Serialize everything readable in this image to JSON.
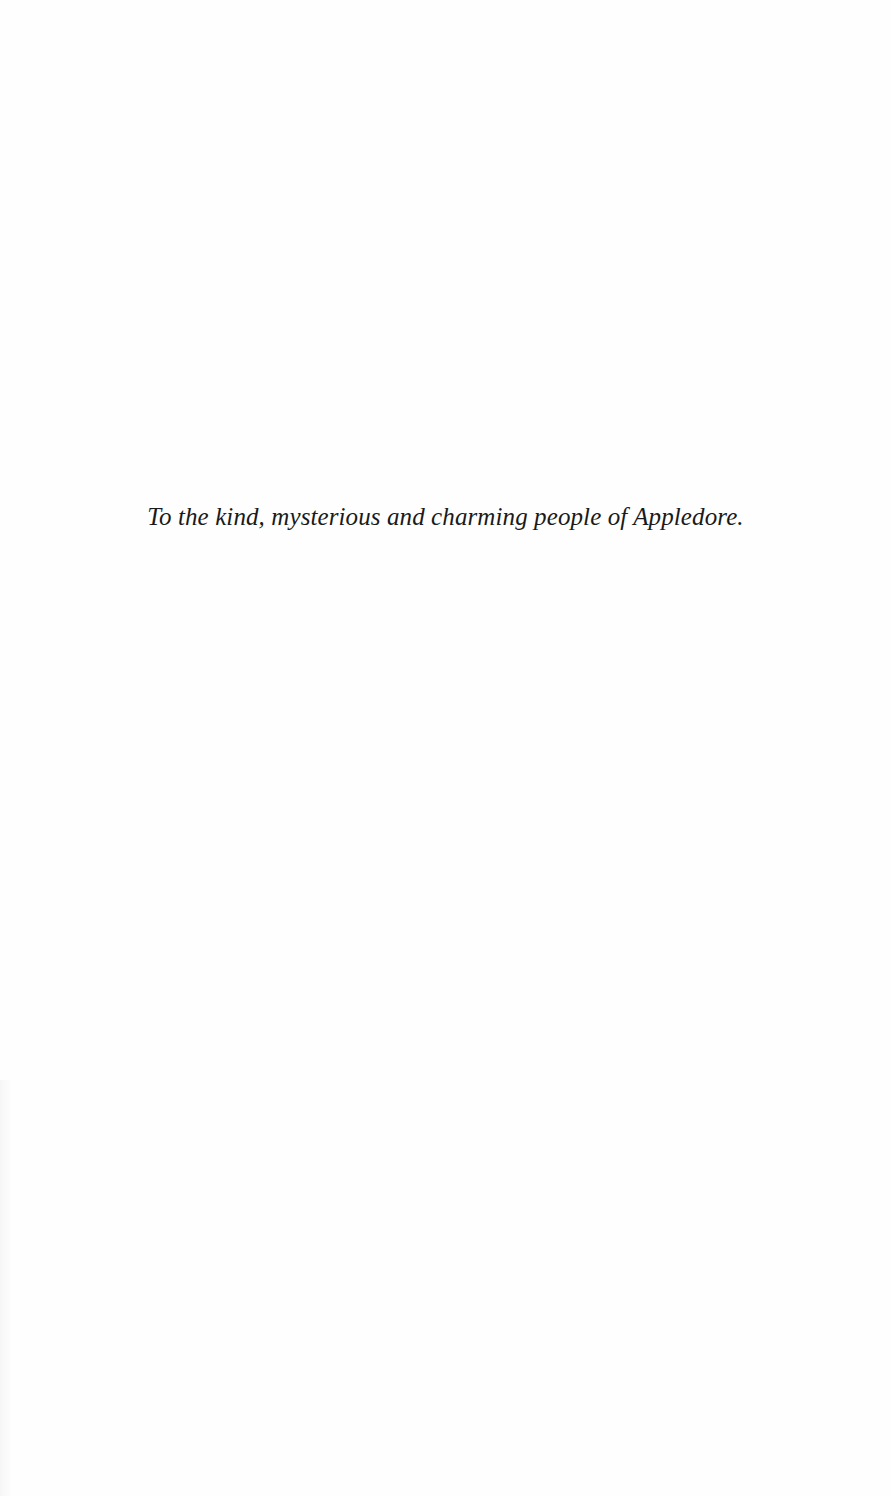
{
  "page": {
    "type": "dedication",
    "dedication_text": "To the kind, mysterious and charming people of Appledore."
  }
}
